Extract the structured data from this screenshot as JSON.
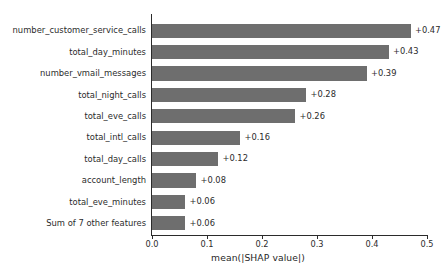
{
  "chart_data": {
    "type": "bar",
    "orientation": "horizontal",
    "title": "",
    "xlabel": "mean(|SHAP value|)",
    "ylabel": "",
    "xlim": [
      0.0,
      0.5
    ],
    "grid": false,
    "bar_color": "#6e6e6e",
    "axis_color": "#2b2b2b",
    "text_color": "#2b2b2b",
    "xticks": [
      0.0,
      0.1,
      0.2,
      0.3,
      0.4,
      0.5
    ],
    "xtick_labels": [
      "0.0",
      "0.1",
      "0.2",
      "0.3",
      "0.4",
      "0.5"
    ],
    "categories": [
      "number_customer_service_calls",
      "total_day_minutes",
      "number_vmail_messages",
      "total_night_calls",
      "total_eve_calls",
      "total_intl_calls",
      "total_day_calls",
      "account_length",
      "total_eve_minutes",
      "Sum of 7 other features"
    ],
    "values": [
      0.47,
      0.43,
      0.39,
      0.28,
      0.26,
      0.16,
      0.12,
      0.08,
      0.06,
      0.06
    ],
    "value_labels": [
      "+0.47",
      "+0.43",
      "+0.39",
      "+0.28",
      "+0.26",
      "+0.16",
      "+0.12",
      "+0.08",
      "+0.06",
      "+0.06"
    ]
  }
}
